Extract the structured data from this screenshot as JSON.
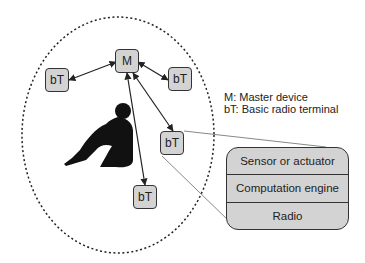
{
  "diagram": {
    "boundary": "body-area-network-ellipse",
    "nodes": [
      {
        "id": "master",
        "label": "M",
        "x": 115,
        "y": 49
      },
      {
        "id": "bt-left",
        "label": "bT",
        "x": 45,
        "y": 68
      },
      {
        "id": "bt-right",
        "label": "bT",
        "x": 168,
        "y": 67
      },
      {
        "id": "bt-middle",
        "label": "bT",
        "x": 160,
        "y": 131
      },
      {
        "id": "bt-bottom",
        "label": "bT",
        "x": 133,
        "y": 185
      }
    ],
    "links": [
      {
        "from": "master",
        "to": "bt-left",
        "type": "bidirectional"
      },
      {
        "from": "master",
        "to": "bt-right",
        "type": "bidirectional"
      },
      {
        "from": "master",
        "to": "bt-middle",
        "type": "bidirectional"
      },
      {
        "from": "master",
        "to": "bt-bottom",
        "type": "bidirectional"
      }
    ],
    "legend": [
      "M: Master device",
      "bT: Basic radio terminal"
    ],
    "terminal_block": {
      "rows": [
        "Sensor or actuator",
        "Computation engine",
        "Radio"
      ]
    },
    "colors": {
      "node_fill": "#d3d3d3",
      "stroke": "#333333",
      "callout_line": "#888888"
    }
  }
}
